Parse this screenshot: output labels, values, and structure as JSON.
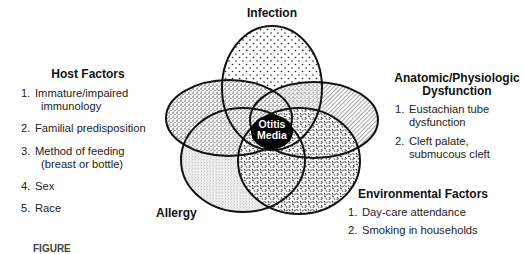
{
  "diagram": {
    "type": "venn",
    "center": {
      "label_line1": "Otitis",
      "label_line2": "Media",
      "fill": "#000000"
    },
    "sets": [
      {
        "id": "infection",
        "title": "Infection",
        "pattern": "sparse-dots"
      },
      {
        "id": "host",
        "title": "Host Factors",
        "pattern": "dense-stipple",
        "items": [
          {
            "num": "1.",
            "line1": "Immature/impaired",
            "line2": "immunology"
          },
          {
            "num": "2.",
            "line1": "Familial predisposition"
          },
          {
            "num": "3.",
            "line1": "Method of feeding",
            "line2": "(breast or bottle)"
          },
          {
            "num": "4.",
            "line1": "Sex"
          },
          {
            "num": "5.",
            "line1": "Race"
          }
        ]
      },
      {
        "id": "anatomic",
        "title_line1": "Anatomic/Physiologic",
        "title_line2": "Dysfunction",
        "pattern": "diagonal-hatch",
        "items": [
          {
            "num": "1.",
            "line1": "Eustachian tube",
            "line2": "dysfunction"
          },
          {
            "num": "2.",
            "line1": "Cleft palate,",
            "line2": "submucous cleft"
          }
        ]
      },
      {
        "id": "allergy",
        "title": "Allergy",
        "pattern": "fine-grain"
      },
      {
        "id": "environmental",
        "title": "Environmental Factors",
        "pattern": "squiggle-texture",
        "items": [
          {
            "num": "1.",
            "line1": "Day-care attendance"
          },
          {
            "num": "2.",
            "line1": "Smoking in households"
          }
        ]
      }
    ],
    "caption_partial": "FIGURE"
  },
  "colors": {
    "outline": "#111111",
    "text": "#222222",
    "background": "#ffffff"
  }
}
